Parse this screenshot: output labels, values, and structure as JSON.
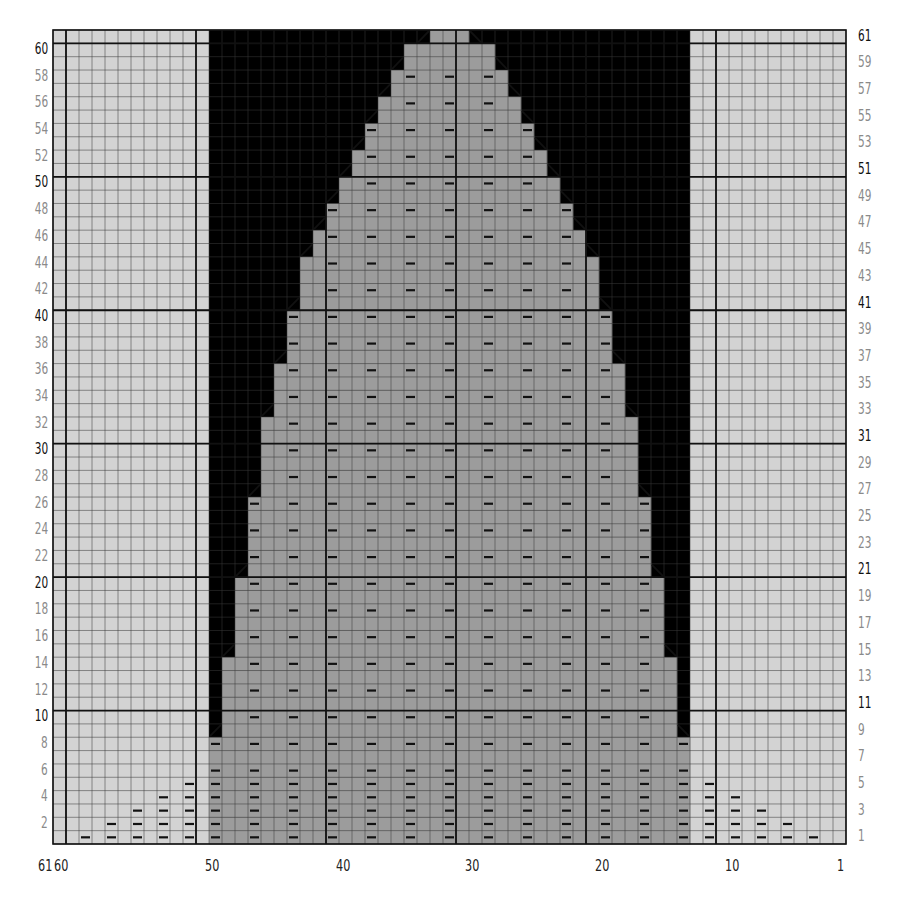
{
  "chart_data": {
    "type": "heatmap",
    "title": "",
    "columns": 61,
    "rows": 61,
    "column_numbering": "right-to-left, 1 at right",
    "row_numbering": "1 at bottom; even rows labeled on left, odd rows on right",
    "x_tick_labels": [
      "61",
      "60",
      "50",
      "40",
      "30",
      "20",
      "10",
      "1"
    ],
    "left_row_labels": [
      "60",
      "58",
      "56",
      "54",
      "52",
      "50",
      "48",
      "46",
      "44",
      "42",
      "40",
      "38",
      "36",
      "34",
      "32",
      "30",
      "28",
      "26",
      "24",
      "22",
      "20",
      "18",
      "16",
      "14",
      "12",
      "10",
      "8",
      "6",
      "4",
      "2"
    ],
    "right_row_labels": [
      "61",
      "59",
      "57",
      "55",
      "53",
      "51",
      "49",
      "47",
      "45",
      "43",
      "41",
      "39",
      "37",
      "35",
      "33",
      "31",
      "29",
      "27",
      "25",
      "23",
      "21",
      "19",
      "17",
      "15",
      "13",
      "11",
      "9",
      "7",
      "5",
      "3",
      "1"
    ],
    "major_row_labels": [
      "60",
      "50",
      "40",
      "30",
      "20",
      "10",
      "61",
      "51",
      "41",
      "31",
      "21",
      "11"
    ],
    "legend": [
      {
        "symbol": "light-gray",
        "meaning": "outside pattern area (side panels)"
      },
      {
        "symbol": "mid-gray",
        "meaning": "stitch in work"
      },
      {
        "symbol": "black",
        "meaning": "no stitch"
      },
      {
        "symbol": "dash",
        "meaning": "purl"
      },
      {
        "symbol": "slash",
        "meaning": "decrease"
      }
    ],
    "shape_rows": [
      {
        "rows": [
          1,
          8
        ],
        "left_col": 49,
        "right_col": 13
      },
      {
        "rows": [
          9,
          14
        ],
        "left_col": 48,
        "right_col": 14
      },
      {
        "rows": [
          15,
          20
        ],
        "left_col": 47,
        "right_col": 15
      },
      {
        "rows": [
          21,
          26
        ],
        "left_col": 46,
        "right_col": 16
      },
      {
        "rows": [
          27,
          32
        ],
        "left_col": 45,
        "right_col": 17
      },
      {
        "rows": [
          33,
          36
        ],
        "left_col": 44,
        "right_col": 18
      },
      {
        "rows": [
          37,
          40
        ],
        "left_col": 43,
        "right_col": 19
      },
      {
        "rows": [
          41,
          44
        ],
        "left_col": 42,
        "right_col": 20
      },
      {
        "rows": [
          45,
          46
        ],
        "left_col": 41,
        "right_col": 21
      },
      {
        "rows": [
          47,
          48
        ],
        "left_col": 40,
        "right_col": 22
      },
      {
        "rows": [
          49,
          50
        ],
        "left_col": 39,
        "right_col": 23
      },
      {
        "rows": [
          51,
          52
        ],
        "left_col": 38,
        "right_col": 24
      },
      {
        "rows": [
          53,
          54
        ],
        "left_col": 37,
        "right_col": 25
      },
      {
        "rows": [
          55,
          56
        ],
        "left_col": 36,
        "right_col": 26
      },
      {
        "rows": [
          57,
          58
        ],
        "left_col": 35,
        "right_col": 27
      },
      {
        "rows": [
          59,
          60
        ],
        "left_col": 34,
        "right_col": 28
      },
      {
        "rows": [
          61,
          61
        ],
        "left_col": 32,
        "right_col": 30
      }
    ],
    "dark_region_cols": [
      50,
      12
    ],
    "side_purl_steps_left": [
      {
        "col": 59,
        "rows": [
          1,
          1
        ]
      },
      {
        "col": 57,
        "rows": [
          1,
          2
        ]
      },
      {
        "col": 55,
        "rows": [
          1,
          3
        ]
      },
      {
        "col": 53,
        "rows": [
          1,
          4
        ]
      },
      {
        "col": 51,
        "rows": [
          1,
          5
        ]
      }
    ],
    "side_purl_steps_right": [
      {
        "col": 11,
        "rows": [
          1,
          5
        ]
      },
      {
        "col": 9,
        "rows": [
          1,
          4
        ]
      },
      {
        "col": 7,
        "rows": [
          1,
          3
        ]
      },
      {
        "col": 5,
        "rows": [
          1,
          2
        ]
      },
      {
        "col": 3,
        "rows": [
          1,
          1
        ]
      }
    ],
    "colors": {
      "side_panel": "#d3d3d3",
      "shape": "#9c9c9c",
      "shape_dark_col": "#8e8e8e",
      "background_dark": "#000000",
      "grid_line": "#3a3a3a",
      "major_grid_line": "#111111",
      "purl_mark": "#111111"
    }
  }
}
